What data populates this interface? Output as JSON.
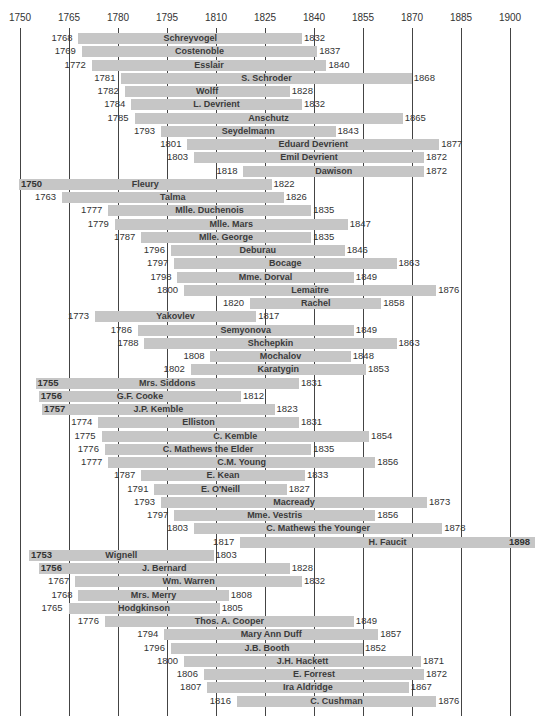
{
  "chart_data": {
    "type": "bar",
    "subtype": "timeline-gantt",
    "title": "",
    "xlabel": "",
    "ylabel": "",
    "xlim": [
      1750,
      1900
    ],
    "x_ticks": [
      1750,
      1765,
      1780,
      1795,
      1810,
      1825,
      1840,
      1855,
      1870,
      1885,
      1900
    ],
    "grid": true,
    "legend": null,
    "series": [
      {
        "name": "Schreyvogel",
        "start": 1768,
        "end": 1832
      },
      {
        "name": "Costenoble",
        "start": 1769,
        "end": 1837
      },
      {
        "name": "Esslair",
        "start": 1772,
        "end": 1840
      },
      {
        "name": "S. Schroder",
        "start": 1781,
        "end": 1868
      },
      {
        "name": "Wolff",
        "start": 1782,
        "end": 1828
      },
      {
        "name": "L. Devrient",
        "start": 1784,
        "end": 1832
      },
      {
        "name": "Anschutz",
        "start": 1785,
        "end": 1865
      },
      {
        "name": "Seydelmann",
        "start": 1793,
        "end": 1843
      },
      {
        "name": "Eduard Devrient",
        "start": 1801,
        "end": 1877
      },
      {
        "name": "Emil Devrient",
        "start": 1803,
        "end": 1872
      },
      {
        "name": "Dawison",
        "start": 1818,
        "end": 1872
      },
      {
        "name": "Fleury",
        "start": 1750,
        "end": 1822,
        "start_inside": true
      },
      {
        "name": "Talma",
        "start": 1763,
        "end": 1826
      },
      {
        "name": "Mlle. Duchenois",
        "start": 1777,
        "end": 1835
      },
      {
        "name": "Mlle. Mars",
        "start": 1779,
        "end": 1847
      },
      {
        "name": "Mlle. George",
        "start": 1787,
        "end": 1835
      },
      {
        "name": "Deburau",
        "start": 1796,
        "end": 1846
      },
      {
        "name": "Bocage",
        "start": 1797,
        "end": 1863
      },
      {
        "name": "Mme. Dorval",
        "start": 1798,
        "end": 1849
      },
      {
        "name": "Lemaitre",
        "start": 1800,
        "end": 1876
      },
      {
        "name": "Rachel",
        "start": 1820,
        "end": 1858
      },
      {
        "name": "Yakovlev",
        "start": 1773,
        "end": 1817
      },
      {
        "name": "Semyonova",
        "start": 1786,
        "end": 1849
      },
      {
        "name": "Shchepkin",
        "start": 1788,
        "end": 1863
      },
      {
        "name": "Mochalov",
        "start": 1808,
        "end": 1848
      },
      {
        "name": "Karatygin",
        "start": 1802,
        "end": 1853
      },
      {
        "name": "Mrs. Siddons",
        "start": 1755,
        "end": 1831,
        "start_inside": true
      },
      {
        "name": "G.F. Cooke",
        "start": 1756,
        "end": 1812,
        "start_inside": true
      },
      {
        "name": "J.P. Kemble",
        "start": 1757,
        "end": 1823,
        "start_inside": true
      },
      {
        "name": "Elliston",
        "start": 1774,
        "end": 1831
      },
      {
        "name": "C. Kemble",
        "start": 1775,
        "end": 1854
      },
      {
        "name": "C. Mathews the Elder",
        "start": 1776,
        "end": 1835
      },
      {
        "name": "C.M. Young",
        "start": 1777,
        "end": 1856
      },
      {
        "name": "E. Kean",
        "start": 1787,
        "end": 1833
      },
      {
        "name": "E. O'Neill",
        "start": 1791,
        "end": 1827
      },
      {
        "name": "Macready",
        "start": 1793,
        "end": 1873
      },
      {
        "name": "Mme. Vestris",
        "start": 1797,
        "end": 1856
      },
      {
        "name": "C. Mathews the Younger",
        "start": 1803,
        "end": 1878
      },
      {
        "name": "H. Faucit",
        "start": 1817,
        "end": 1898,
        "end_inside": true
      },
      {
        "name": "Wignell",
        "start": 1753,
        "end": 1803,
        "start_inside": true
      },
      {
        "name": "J. Bernard",
        "start": 1756,
        "end": 1828,
        "start_inside": true
      },
      {
        "name": "Wm. Warren",
        "start": 1767,
        "end": 1832
      },
      {
        "name": "Mrs. Merry",
        "start": 1768,
        "end": 1808
      },
      {
        "name": "Hodgkinson",
        "start": 1765,
        "end": 1805
      },
      {
        "name": "Thos. A. Cooper",
        "start": 1776,
        "end": 1849
      },
      {
        "name": "Mary Ann Duff",
        "start": 1794,
        "end": 1857
      },
      {
        "name": "J.B. Booth",
        "start": 1796,
        "end": 1852
      },
      {
        "name": "J.H. Hackett",
        "start": 1800,
        "end": 1871
      },
      {
        "name": "E. Forrest",
        "start": 1806,
        "end": 1872
      },
      {
        "name": "Ira Aldridge",
        "start": 1807,
        "end": 1867
      },
      {
        "name": "C. Cushman",
        "start": 1816,
        "end": 1876
      }
    ]
  },
  "colors": {
    "bar": "#c6c6c6",
    "gridline": "#444444",
    "text": "#333333"
  }
}
